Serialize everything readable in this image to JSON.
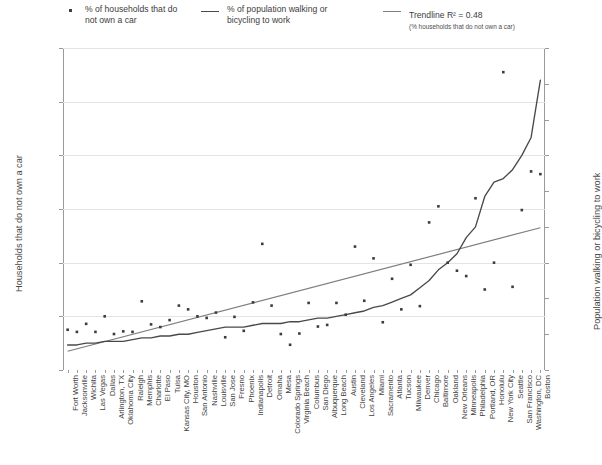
{
  "legend": {
    "entries": [
      {
        "marker": "dot",
        "label": "% of households that do\nnot own a car",
        "sub": ""
      },
      {
        "marker": "line",
        "label": "% of population walking or\nbicycling to work",
        "sub": ""
      },
      {
        "marker": "line2",
        "label": "Trendline R² = 0.48",
        "sub": "(% households that do not own a car)"
      }
    ]
  },
  "axes": {
    "left_title": "Households that do not own a car",
    "right_title": "Population walking or bicycling to work",
    "left_ticks": [
      "0%",
      "10%",
      "20%",
      "30%",
      "40%",
      "50%",
      "60%"
    ],
    "right_ticks": [
      "0%",
      "2%",
      "4%",
      "6%",
      "8%",
      "10%",
      "12%",
      "14%",
      "16%",
      "18%"
    ]
  },
  "chart_data": {
    "type": "scatter",
    "title": "",
    "xlabel": "",
    "ylabel": "Households that do not own a car",
    "y2label": "Population walking or bicycling to work",
    "ylim": [
      0,
      60
    ],
    "y2lim": [
      0,
      18
    ],
    "grid": true,
    "legend_position": "top",
    "categories": [
      "Fort Worth",
      "Jacksonville",
      "Wichita",
      "Las Vegas",
      "Dallas",
      "Arlington, TX",
      "Oklahoma City",
      "Raleigh",
      "Memphis",
      "Charlotte",
      "El Paso",
      "Tulsa",
      "Kansas City, MO",
      "Houston",
      "San Antonio",
      "Nashville",
      "Louisville",
      "San Jose",
      "Fresno",
      "Phoenix",
      "Indianapolis",
      "Detroit",
      "Omaha",
      "Mesa",
      "Colorado Springs",
      "Virginia Beach",
      "Columbus",
      "San Diego",
      "Albuquerque",
      "Long Beach",
      "Austin",
      "Cleveland",
      "Los Angeles",
      "Miami",
      "Sacramento",
      "Atlanta",
      "Tucson",
      "Milwaukee",
      "Denver",
      "Chicago",
      "Baltimore",
      "Oakland",
      "New Orleans",
      "Minneapolis",
      "Philadelphia",
      "Portland, OR",
      "Honolulu",
      "New York City",
      "Seattle",
      "San Francisco",
      "Washington, DC",
      "Boston"
    ],
    "series": [
      {
        "name": "% of households that do not own a car",
        "axis": "left",
        "type": "scatter",
        "values": [
          7.5,
          7.1,
          8.6,
          7.1,
          10.0,
          6.7,
          7.2,
          7.1,
          12.8,
          8.5,
          8.0,
          9.3,
          12.0,
          11.3,
          10.0,
          9.7,
          10.7,
          6.1,
          9.9,
          7.3,
          12.6,
          23.5,
          12.0,
          6.7,
          4.7,
          6.8,
          12.5,
          8.1,
          8.4,
          12.5,
          10.3,
          23.0,
          12.9,
          20.8,
          8.9,
          17.0,
          11.3,
          19.6,
          11.9,
          27.5,
          30.5,
          20.0,
          18.5,
          17.5,
          32.0,
          15.0,
          20.0,
          55.5,
          15.5,
          29.8,
          37.0,
          36.5
        ]
      },
      {
        "name": "% of population walking or bicycling to work",
        "axis": "right",
        "type": "line",
        "values": [
          1.4,
          1.4,
          1.5,
          1.5,
          1.6,
          1.6,
          1.6,
          1.7,
          1.8,
          1.8,
          1.9,
          1.9,
          2.0,
          2.0,
          2.1,
          2.2,
          2.3,
          2.4,
          2.4,
          2.4,
          2.5,
          2.6,
          2.6,
          2.6,
          2.7,
          2.7,
          2.8,
          2.9,
          2.9,
          3.0,
          3.1,
          3.2,
          3.3,
          3.5,
          3.6,
          3.8,
          4.0,
          4.2,
          4.6,
          5.0,
          5.6,
          6.0,
          6.5,
          7.4,
          8.0,
          9.7,
          10.5,
          10.7,
          11.2,
          12.0,
          13.0,
          16.2
        ]
      },
      {
        "name": "Trendline R² = 0.48",
        "axis": "left",
        "type": "trendline",
        "endpoints": [
          3.5,
          26.5
        ]
      }
    ]
  }
}
